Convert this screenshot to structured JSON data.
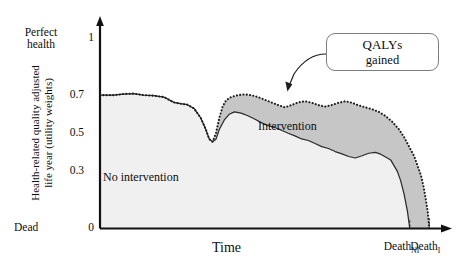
{
  "chart_data": {
    "type": "area",
    "title": "",
    "xlabel": "Time",
    "ylabel": "Health-related quality adjusted life year (utility weights)",
    "ylim": [
      0,
      1
    ],
    "yticks": [
      0,
      0.3,
      0.5,
      0.7,
      1
    ],
    "ytick_labels": [
      "0",
      "0.3",
      "0.5",
      "0.7",
      "1"
    ],
    "y_axis_top_annotation": "Perfect health",
    "y_axis_bottom_annotation": "Dead",
    "grid": false,
    "legend": "inline-annotations",
    "x_event_markers": [
      {
        "label": "Death_NI",
        "display": "Death",
        "subscript": "NI",
        "description": "Death without intervention"
      },
      {
        "label": "Death_I",
        "display": "Death",
        "subscript": "I",
        "description": "Death with intervention"
      }
    ],
    "series": [
      {
        "name": "No intervention",
        "style": "solid-line",
        "fill": "light-gray",
        "points": [
          [
            0.0,
            0.7
          ],
          [
            0.04,
            0.7
          ],
          [
            0.07,
            0.706
          ],
          [
            0.1,
            0.708
          ],
          [
            0.13,
            0.7
          ],
          [
            0.16,
            0.697
          ],
          [
            0.19,
            0.69
          ],
          [
            0.22,
            0.662
          ],
          [
            0.24,
            0.655
          ],
          [
            0.26,
            0.65
          ],
          [
            0.28,
            0.63
          ],
          [
            0.3,
            0.58
          ],
          [
            0.315,
            0.52
          ],
          [
            0.325,
            0.47
          ],
          [
            0.335,
            0.455
          ],
          [
            0.345,
            0.468
          ],
          [
            0.355,
            0.52
          ],
          [
            0.37,
            0.57
          ],
          [
            0.385,
            0.6
          ],
          [
            0.4,
            0.612
          ],
          [
            0.42,
            0.606
          ],
          [
            0.44,
            0.592
          ],
          [
            0.46,
            0.575
          ],
          [
            0.48,
            0.556
          ],
          [
            0.5,
            0.54
          ],
          [
            0.52,
            0.53
          ],
          [
            0.54,
            0.516
          ],
          [
            0.56,
            0.5
          ],
          [
            0.58,
            0.486
          ],
          [
            0.6,
            0.47
          ],
          [
            0.62,
            0.462
          ],
          [
            0.64,
            0.446
          ],
          [
            0.66,
            0.43
          ],
          [
            0.68,
            0.42
          ],
          [
            0.7,
            0.404
          ],
          [
            0.72,
            0.392
          ],
          [
            0.74,
            0.378
          ],
          [
            0.76,
            0.37
          ],
          [
            0.78,
            0.382
          ],
          [
            0.8,
            0.395
          ],
          [
            0.82,
            0.4
          ],
          [
            0.835,
            0.39
          ],
          [
            0.85,
            0.375
          ],
          [
            0.865,
            0.36
          ],
          [
            0.875,
            0.33
          ],
          [
            0.885,
            0.3
          ],
          [
            0.895,
            0.25
          ],
          [
            0.905,
            0.18
          ],
          [
            0.915,
            0.09
          ],
          [
            0.922,
            0.0
          ]
        ],
        "death_x": 0.922
      },
      {
        "name": "Intervention",
        "style": "dotted-line",
        "fill": "medium-gray",
        "points": [
          [
            0.0,
            0.7
          ],
          [
            0.04,
            0.7
          ],
          [
            0.07,
            0.706
          ],
          [
            0.1,
            0.708
          ],
          [
            0.13,
            0.7
          ],
          [
            0.16,
            0.697
          ],
          [
            0.19,
            0.69
          ],
          [
            0.22,
            0.662
          ],
          [
            0.24,
            0.655
          ],
          [
            0.26,
            0.65
          ],
          [
            0.28,
            0.63
          ],
          [
            0.3,
            0.58
          ],
          [
            0.315,
            0.52
          ],
          [
            0.325,
            0.47
          ],
          [
            0.335,
            0.455
          ],
          [
            0.345,
            0.5
          ],
          [
            0.355,
            0.58
          ],
          [
            0.365,
            0.64
          ],
          [
            0.375,
            0.672
          ],
          [
            0.39,
            0.69
          ],
          [
            0.41,
            0.7
          ],
          [
            0.43,
            0.704
          ],
          [
            0.45,
            0.7
          ],
          [
            0.47,
            0.69
          ],
          [
            0.49,
            0.676
          ],
          [
            0.51,
            0.662
          ],
          [
            0.53,
            0.648
          ],
          [
            0.55,
            0.636
          ],
          [
            0.57,
            0.648
          ],
          [
            0.59,
            0.662
          ],
          [
            0.61,
            0.668
          ],
          [
            0.63,
            0.66
          ],
          [
            0.65,
            0.648
          ],
          [
            0.67,
            0.64
          ],
          [
            0.69,
            0.648
          ],
          [
            0.71,
            0.66
          ],
          [
            0.73,
            0.668
          ],
          [
            0.75,
            0.66
          ],
          [
            0.77,
            0.646
          ],
          [
            0.79,
            0.636
          ],
          [
            0.81,
            0.626
          ],
          [
            0.83,
            0.612
          ],
          [
            0.85,
            0.59
          ],
          [
            0.87,
            0.56
          ],
          [
            0.89,
            0.52
          ],
          [
            0.905,
            0.48
          ],
          [
            0.92,
            0.43
          ],
          [
            0.935,
            0.38
          ],
          [
            0.945,
            0.33
          ],
          [
            0.955,
            0.28
          ],
          [
            0.963,
            0.22
          ],
          [
            0.97,
            0.15
          ],
          [
            0.976,
            0.08
          ],
          [
            0.98,
            0.0
          ]
        ],
        "death_x": 0.98
      }
    ],
    "annotations": [
      {
        "name": "no-intervention-area-label",
        "text": "No intervention"
      },
      {
        "name": "intervention-area-label",
        "text": "Intervention"
      },
      {
        "name": "qalys-gained-callout",
        "text_line1": "QALYs",
        "text_line2": "gained",
        "has_arrow": true
      }
    ],
    "colors": {
      "axis": "#111111",
      "no_intervention_fill": "#f0f0f0",
      "intervention_fill": "#c6c6c6",
      "line": "#2b2b2b",
      "callout_border": "#7d7d7d",
      "text": "#0d0d0d"
    }
  },
  "axes": {
    "y": {
      "top_label": "Perfect\nhealth",
      "top_label_line1": "Perfect",
      "top_label_line2": "health",
      "bottom_label": "Dead",
      "title_line1": "Health-related quality adjusted",
      "title_line2": "life year (utility weights)",
      "ticks": {
        "t1": "1",
        "t07": "0.7",
        "t05": "0.5",
        "t03": "0.3",
        "t0": "0"
      }
    },
    "x": {
      "title": "Time",
      "death_ni_base": "Death",
      "death_ni_sub": "NI",
      "death_i_base": "Death",
      "death_i_sub": "I"
    }
  },
  "labels": {
    "no_intervention": "No intervention",
    "intervention": "Intervention",
    "callout_line1": "QALYs",
    "callout_line2": "gained"
  }
}
